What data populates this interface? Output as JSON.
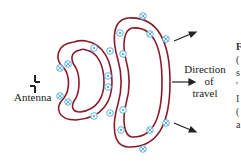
{
  "diagram": {
    "labels": {
      "antenna": "Antenna",
      "direction_line1": "Direction",
      "direction_line2": "of",
      "direction_line3": "travel"
    },
    "colors": {
      "field_loop": "#8b1a2b",
      "field_marker": "#4aa8d8",
      "text": "#222222",
      "arrow": "#222222"
    },
    "legend_symbols": {
      "into_page": "⊗",
      "out_of_page": "⊙"
    },
    "cropped_right_text": [
      "F",
      "(",
      "s",
      "'",
      "I",
      "(",
      "a"
    ]
  }
}
